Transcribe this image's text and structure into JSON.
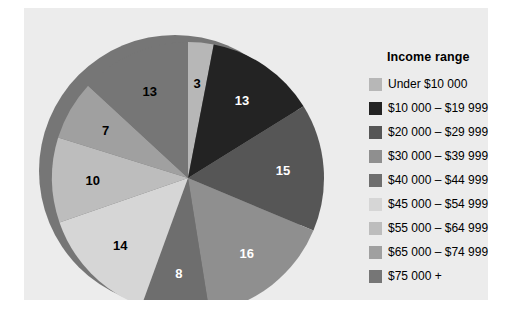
{
  "chart_data": {
    "type": "pie",
    "title": "",
    "legend_title": "Income range",
    "legend_position": "right",
    "categories": [
      "Under  $10 000",
      "$10 000 – $19 999",
      "$20 000 – $29 999",
      "$30 000 – $39 999",
      "$40 000 – $44 999",
      "$45 000 – $54 999",
      "$55 000 – $64 999",
      "$65 000 – $74 999",
      "$75 000 +"
    ],
    "values": [
      3,
      13,
      15,
      16,
      8,
      14,
      10,
      7,
      13
    ],
    "value_suffix": "",
    "colors": [
      "#b7b7b7",
      "#232323",
      "#565656",
      "#8f8f8f",
      "#6e6e6e",
      "#d6d6d6",
      "#bdbdbd",
      "#a0a0a0",
      "#767676"
    ],
    "label_text_colors": [
      "dark",
      "light",
      "light",
      "light",
      "light",
      "dark",
      "dark",
      "dark",
      "dark"
    ],
    "slice_labels": [
      "3",
      "13",
      "15",
      "16",
      "8",
      "14",
      "10",
      "7",
      "13"
    ],
    "background": "#ececec",
    "grid": false,
    "xlabel": "",
    "ylabel": ""
  },
  "legend": {
    "title": "Income range",
    "items": [
      {
        "label": "Under  $10 000",
        "color": "#b7b7b7"
      },
      {
        "label": "$10 000 – $19 999",
        "color": "#232323"
      },
      {
        "label": "$20 000 – $29 999",
        "color": "#565656"
      },
      {
        "label": "$30 000 – $39 999",
        "color": "#8f8f8f"
      },
      {
        "label": "$40 000 – $44 999",
        "color": "#6e6e6e"
      },
      {
        "label": "$45 000 – $54 999",
        "color": "#d6d6d6"
      },
      {
        "label": "$55 000 – $64 999",
        "color": "#bdbdbd"
      },
      {
        "label": "$65 000 – $74 999",
        "color": "#a0a0a0"
      },
      {
        "label": "$75 000 +",
        "color": "#767676"
      }
    ]
  }
}
